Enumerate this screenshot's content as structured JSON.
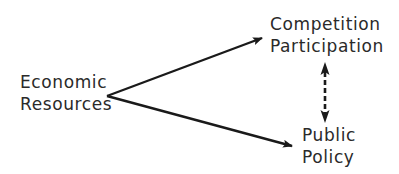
{
  "diagram": {
    "nodes": {
      "economic_resources": {
        "line1": "Economic",
        "line2": "Resources"
      },
      "competition_participation": {
        "line1": "Competition",
        "line2": "Participation"
      },
      "public_policy": {
        "line1": "Public",
        "line2": "Policy"
      }
    },
    "edges": [
      {
        "from": "economic_resources",
        "to": "competition_participation",
        "style": "solid",
        "direction": "forward"
      },
      {
        "from": "economic_resources",
        "to": "public_policy",
        "style": "solid",
        "direction": "forward"
      },
      {
        "from": "competition_participation",
        "to": "public_policy",
        "style": "dashed",
        "direction": "both"
      }
    ],
    "colors": {
      "ink": "#1a1a1a",
      "text": "#2a2a2a",
      "background": "#ffffff"
    }
  }
}
